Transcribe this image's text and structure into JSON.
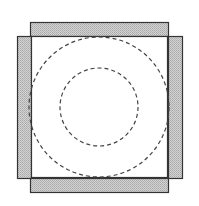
{
  "diagram": {
    "colors": {
      "background": "#ffffff",
      "bar_fill": "#c8c8c8",
      "stroke": "#333333",
      "dash_stroke": "#444444"
    },
    "bars": [
      {
        "id": "top",
        "x": 30,
        "y": 22,
        "w": 138,
        "h": 14
      },
      {
        "id": "left",
        "x": 17,
        "y": 36,
        "w": 14,
        "h": 142
      },
      {
        "id": "right",
        "x": 168,
        "y": 36,
        "w": 14,
        "h": 142
      },
      {
        "id": "bottom",
        "x": 30,
        "y": 178,
        "w": 138,
        "h": 14
      }
    ],
    "circles": [
      {
        "id": "outer",
        "cx": 99,
        "cy": 107,
        "r": 70,
        "style": "dashed"
      },
      {
        "id": "inner",
        "cx": 99,
        "cy": 107,
        "r": 39,
        "style": "dashed"
      }
    ]
  }
}
